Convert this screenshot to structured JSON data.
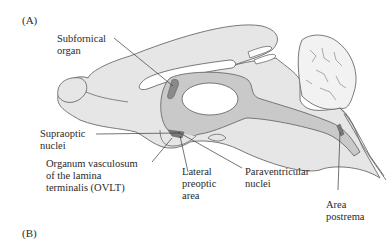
{
  "figure": {
    "panels": [
      {
        "id": "A",
        "label": "(A)"
      },
      {
        "id": "B",
        "label": "(B)"
      }
    ],
    "labels": {
      "subfornical_organ": "Subfornical\norgan",
      "supraoptic_nuclei": "Supraoptic\nnuclei",
      "ovlt": "Organum vasculosum\nof the lamina\nterminalis (OVLT)",
      "lateral_preoptic_area": "Lateral\npreoptic\narea",
      "paraventricular_nuclei": "Paraventricular\nnuclei",
      "area_postrema": "Area\npostrema"
    },
    "colors": {
      "brain_fill": "#e6e6e6",
      "ventricle_fill": "#c9c9c9",
      "structure_fill": "#8a8a8a",
      "outline": "#6a6a6a",
      "leader_line": "#3a3a3a",
      "cerebellum_fill": "#f2f2f2"
    }
  }
}
